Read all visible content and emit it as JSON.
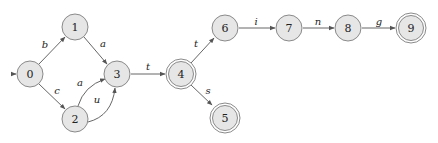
{
  "diagram": {
    "type": "finite-state-automaton",
    "start_state": "0",
    "nodes": [
      {
        "id": "0",
        "label": "0",
        "x": 30,
        "y": 74,
        "accepting": false
      },
      {
        "id": "1",
        "label": "1",
        "x": 75,
        "y": 27,
        "accepting": false
      },
      {
        "id": "2",
        "label": "2",
        "x": 75,
        "y": 119,
        "accepting": false
      },
      {
        "id": "3",
        "label": "3",
        "x": 117,
        "y": 74,
        "accepting": false
      },
      {
        "id": "4",
        "label": "4",
        "x": 181,
        "y": 74,
        "accepting": true
      },
      {
        "id": "5",
        "label": "5",
        "x": 225,
        "y": 118,
        "accepting": true
      },
      {
        "id": "6",
        "label": "6",
        "x": 225,
        "y": 28,
        "accepting": false
      },
      {
        "id": "7",
        "label": "7",
        "x": 289,
        "y": 28,
        "accepting": false
      },
      {
        "id": "8",
        "label": "8",
        "x": 348,
        "y": 28,
        "accepting": false
      },
      {
        "id": "9",
        "label": "9",
        "x": 411,
        "y": 28,
        "accepting": true
      }
    ],
    "edges": [
      {
        "from": "0",
        "to": "1",
        "label": "b"
      },
      {
        "from": "0",
        "to": "2",
        "label": "c"
      },
      {
        "from": "1",
        "to": "3",
        "label": "a"
      },
      {
        "from": "2",
        "to": "3",
        "label": "a"
      },
      {
        "from": "2",
        "to": "3",
        "label": "u"
      },
      {
        "from": "3",
        "to": "4",
        "label": "t"
      },
      {
        "from": "4",
        "to": "6",
        "label": "t"
      },
      {
        "from": "4",
        "to": "5",
        "label": "s"
      },
      {
        "from": "6",
        "to": "7",
        "label": "i"
      },
      {
        "from": "7",
        "to": "8",
        "label": "n"
      },
      {
        "from": "8",
        "to": "9",
        "label": "g"
      }
    ],
    "colors": {
      "node_fill": "#e6e6e6",
      "node_stroke": "#8a8a8a",
      "edge": "#555555"
    }
  }
}
